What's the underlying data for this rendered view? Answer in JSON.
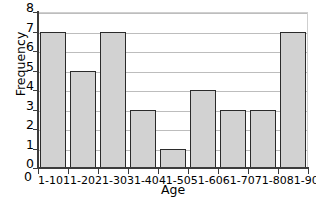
{
  "chart_data": {
    "type": "bar",
    "title": "",
    "xlabel": "Age",
    "ylabel": "Frequency",
    "categories": [
      "1-10",
      "11-20",
      "21-30",
      "31-40",
      "41-50",
      "51-60",
      "61-70",
      "71-80",
      "81-90"
    ],
    "values": [
      7,
      5,
      7,
      3,
      1,
      4,
      3,
      3,
      7
    ],
    "ylim": [
      0,
      8
    ],
    "y_ticks": [
      0,
      1,
      2,
      3,
      4,
      5,
      6,
      7,
      8
    ],
    "grid": "horizontal",
    "legend": "none",
    "origin_label": "0",
    "bar_fill_color": "#d2d2d2",
    "bar_border_color": "#2b2b2b",
    "gridline_color": "#bdbdbd",
    "axis_color": "#3c3c3c",
    "background_color": "#ffffff"
  }
}
